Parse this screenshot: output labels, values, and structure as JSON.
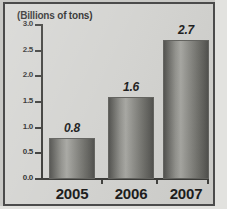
{
  "figure": {
    "title": "(Billions of tons)",
    "frame_color": "#4b4b4b",
    "background_color": "#d2d2cf",
    "bar_color_dark": "#4d4d4a",
    "bar_color_light": "#a5a5a0"
  },
  "chart_data": {
    "type": "bar",
    "title": "(Billions of tons)",
    "xlabel": "",
    "ylabel": "(Billions of tons)",
    "categories": [
      "2005",
      "2006",
      "2007"
    ],
    "values": [
      0.8,
      1.6,
      2.7
    ],
    "value_labels": [
      "0.8",
      "1.6",
      "2.7"
    ],
    "ylim": [
      0.0,
      3.0
    ],
    "ytick_labels": [
      "3.0",
      "2.5",
      "2.0",
      "1.5",
      "1.0",
      "0.5",
      "0.0"
    ],
    "ytick_values": [
      3.0,
      2.5,
      2.0,
      1.5,
      1.0,
      0.5,
      0.0
    ],
    "grid": false,
    "legend": null
  }
}
